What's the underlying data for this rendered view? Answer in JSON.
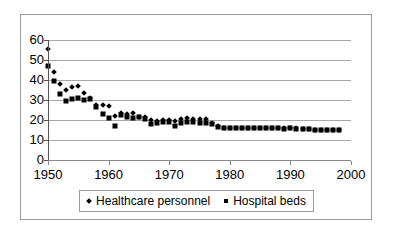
{
  "chart_data": {
    "type": "scatter",
    "title": "",
    "subtitle": "",
    "xlabel": "",
    "ylabel": "",
    "xlim": [
      1950,
      2000
    ],
    "ylim": [
      0,
      60
    ],
    "grid": true,
    "grid_axis": "y",
    "legend_position": "bottom",
    "xticks": [
      1950,
      1960,
      1970,
      1980,
      1990,
      2000
    ],
    "yticks": [
      0,
      10,
      20,
      30,
      40,
      50,
      60
    ],
    "xtick_labels": [
      "1950",
      "1960",
      "1970",
      "1980",
      "1990",
      "2000"
    ],
    "ytick_labels": [
      "0",
      "10",
      "20",
      "30",
      "40",
      "50",
      "60"
    ],
    "x": [
      1950,
      1951,
      1952,
      1953,
      1954,
      1955,
      1956,
      1957,
      1958,
      1959,
      1960,
      1961,
      1962,
      1963,
      1964,
      1965,
      1966,
      1967,
      1968,
      1969,
      1970,
      1971,
      1972,
      1973,
      1974,
      1975,
      1976,
      1977,
      1978,
      1979,
      1980,
      1981,
      1982,
      1983,
      1984,
      1985,
      1986,
      1987,
      1988,
      1989,
      1990,
      1991,
      1992,
      1993,
      1994,
      1995,
      1996,
      1997,
      1998
    ],
    "series": [
      {
        "name": "Healthcare personnel",
        "marker": "diamond",
        "color": "#000000",
        "values": [
          55.5,
          44.0,
          38.0,
          35.0,
          36.5,
          37.0,
          33.5,
          31.0,
          27.5,
          27.5,
          27.0,
          22.0,
          23.5,
          23.0,
          23.5,
          21.5,
          21.5,
          20.0,
          19.5,
          20.0,
          20.0,
          19.5,
          20.5,
          21.0,
          20.5,
          20.5,
          20.5,
          18.5,
          17.0,
          16.0,
          16.0,
          16.0,
          16.0,
          16.0,
          16.0,
          16.0,
          16.0,
          16.0,
          16.0,
          16.0,
          16.0,
          16.0,
          15.5,
          15.5,
          15.0,
          15.0,
          15.0,
          15.0,
          15.0
        ]
      },
      {
        "name": "Hospital beds",
        "marker": "square",
        "color": "#000000",
        "values": [
          47.0,
          39.5,
          33.0,
          29.5,
          30.5,
          31.0,
          30.0,
          30.5,
          26.5,
          23.0,
          21.0,
          17.0,
          22.5,
          21.5,
          21.0,
          21.5,
          20.5,
          18.0,
          18.5,
          19.0,
          19.0,
          17.0,
          18.5,
          19.0,
          19.0,
          18.5,
          18.5,
          18.0,
          16.5,
          16.0,
          16.0,
          16.0,
          16.0,
          16.0,
          16.0,
          16.0,
          16.0,
          16.0,
          16.0,
          15.5,
          16.0,
          15.5,
          15.5,
          15.5,
          15.0,
          15.0,
          15.0,
          15.0,
          15.0
        ]
      }
    ]
  },
  "legend": {
    "entries": [
      {
        "label": "Healthcare personnel",
        "marker": "diamond"
      },
      {
        "label": "Hospital beds",
        "marker": "square"
      }
    ]
  },
  "colors": {
    "marker": "#000000",
    "gridline": "#a8a8a8",
    "axis": "#555555",
    "frame": "#9a9a9a",
    "background": "#ffffff"
  }
}
